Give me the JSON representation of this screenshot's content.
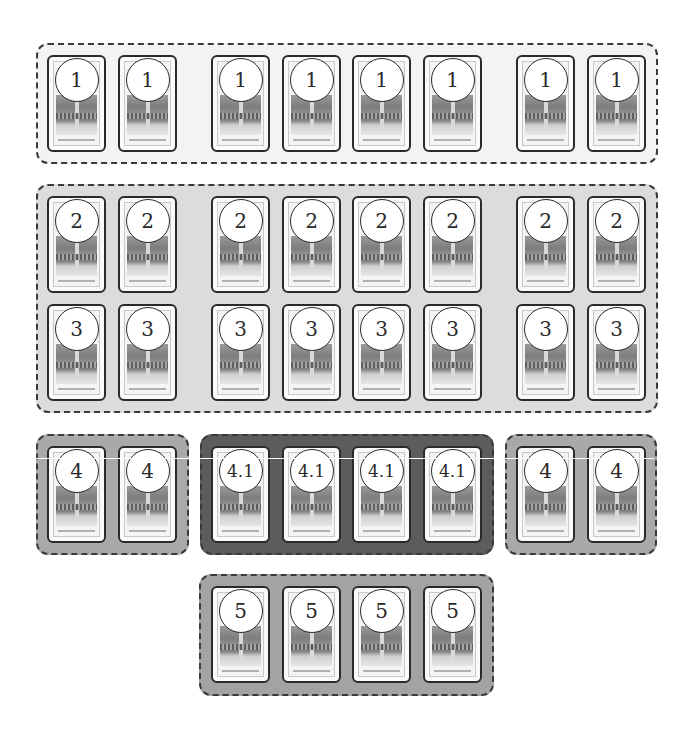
{
  "colors": {
    "group_level_1": "#f3f3f3",
    "group_level_2_3": "#dcdcdc",
    "group_level_4": "#a9a9a9",
    "group_level_4_1": "#5c5c5c",
    "group_level_5": "#a3a3a3",
    "border": "#3a3a3a",
    "card_border": "#2a2a2a"
  },
  "groups": [
    {
      "id": "group-level-1",
      "x": 36,
      "y": 43,
      "w": 622,
      "h": 121,
      "bg": "#f3f3f3"
    },
    {
      "id": "group-level-2-3",
      "x": 36,
      "y": 184,
      "w": 622,
      "h": 229,
      "bg": "#dcdcdc"
    },
    {
      "id": "group-level-4-left",
      "x": 36,
      "y": 434,
      "w": 153,
      "h": 121,
      "bg": "#a9a9a9"
    },
    {
      "id": "group-level-4-1",
      "x": 200,
      "y": 434,
      "w": 294,
      "h": 121,
      "bg": "#5c5c5c"
    },
    {
      "id": "group-level-4-right",
      "x": 505,
      "y": 434,
      "w": 152,
      "h": 121,
      "bg": "#a9a9a9"
    },
    {
      "id": "group-level-5",
      "x": 199,
      "y": 574,
      "w": 295,
      "h": 122,
      "bg": "#a3a3a3"
    }
  ],
  "cards": [
    {
      "label": "1",
      "x": 47,
      "y": 55
    },
    {
      "label": "1",
      "x": 118,
      "y": 55
    },
    {
      "label": "1",
      "x": 211,
      "y": 55
    },
    {
      "label": "1",
      "x": 282,
      "y": 55
    },
    {
      "label": "1",
      "x": 352,
      "y": 55
    },
    {
      "label": "1",
      "x": 423,
      "y": 55
    },
    {
      "label": "1",
      "x": 516,
      "y": 55
    },
    {
      "label": "1",
      "x": 587,
      "y": 55
    },
    {
      "label": "2",
      "x": 47,
      "y": 196
    },
    {
      "label": "2",
      "x": 118,
      "y": 196
    },
    {
      "label": "2",
      "x": 211,
      "y": 196
    },
    {
      "label": "2",
      "x": 282,
      "y": 196
    },
    {
      "label": "2",
      "x": 352,
      "y": 196
    },
    {
      "label": "2",
      "x": 423,
      "y": 196
    },
    {
      "label": "2",
      "x": 516,
      "y": 196
    },
    {
      "label": "2",
      "x": 587,
      "y": 196
    },
    {
      "label": "3",
      "x": 47,
      "y": 304
    },
    {
      "label": "3",
      "x": 118,
      "y": 304
    },
    {
      "label": "3",
      "x": 211,
      "y": 304
    },
    {
      "label": "3",
      "x": 282,
      "y": 304
    },
    {
      "label": "3",
      "x": 352,
      "y": 304
    },
    {
      "label": "3",
      "x": 423,
      "y": 304
    },
    {
      "label": "3",
      "x": 516,
      "y": 304
    },
    {
      "label": "3",
      "x": 587,
      "y": 304
    },
    {
      "label": "4",
      "x": 47,
      "y": 446
    },
    {
      "label": "4",
      "x": 118,
      "y": 446
    },
    {
      "label": "4.1",
      "x": 211,
      "y": 446
    },
    {
      "label": "4.1",
      "x": 282,
      "y": 446
    },
    {
      "label": "4.1",
      "x": 352,
      "y": 446
    },
    {
      "label": "4.1",
      "x": 423,
      "y": 446
    },
    {
      "label": "4",
      "x": 516,
      "y": 446
    },
    {
      "label": "4",
      "x": 587,
      "y": 446
    },
    {
      "label": "5",
      "x": 211,
      "y": 586
    },
    {
      "label": "5",
      "x": 282,
      "y": 586
    },
    {
      "label": "5",
      "x": 352,
      "y": 586
    },
    {
      "label": "5",
      "x": 423,
      "y": 586
    }
  ]
}
